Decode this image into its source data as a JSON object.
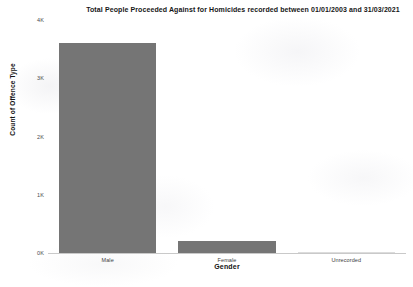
{
  "chart_data": {
    "type": "bar",
    "title": "Total People Proceeded Against for Homicides recorded between 01/01/2003 and 31/03/2021",
    "xlabel": "Gender",
    "ylabel": "Count of Offence Type",
    "categories": [
      "Male",
      "Female",
      "Unrecorded"
    ],
    "values": [
      3605,
      208,
      4
    ],
    "ylim": [
      0,
      4000
    ],
    "yticks": [
      0,
      1000,
      2000,
      3000,
      4000
    ],
    "ytick_labels": [
      "0K",
      "1K",
      "2K",
      "3K",
      "4K"
    ],
    "grid": false,
    "legend": false,
    "bar_color": "#757575",
    "baseline_color": "#c9c9c9",
    "background": "#ffffff"
  }
}
